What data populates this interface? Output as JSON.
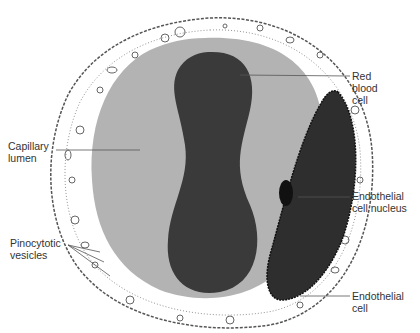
{
  "labels": {
    "capillary_lumen": "Capillary\nlumen",
    "red_blood_cell": "Red\nblood\ncell",
    "endothelial_nucleus": "Endothelial\ncell nucleus",
    "pinocytotic_vesicles": "Pinocytotic\nvesicles",
    "endothelial_cell": "Endothelial\ncell"
  },
  "colors": {
    "lumen": "#b3b3b3",
    "rbc": "#3a3a3a",
    "endothelial_cytoplasm": "#2e2e2e",
    "nucleus": "#111111",
    "wall": "#ffffff",
    "outline": "#555555"
  }
}
